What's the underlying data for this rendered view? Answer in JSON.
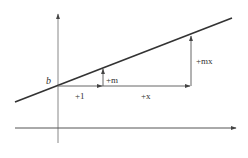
{
  "diagram": {
    "type": "linear-function-slope-intercept",
    "labels": {
      "intercept": "b",
      "unit_run": "+1",
      "unit_rise": "+m",
      "run": "+x",
      "rise": "+mx"
    },
    "colors": {
      "line": "#333333",
      "axes": "#555555",
      "arrows": "#666666",
      "background": "#ffffff"
    }
  }
}
